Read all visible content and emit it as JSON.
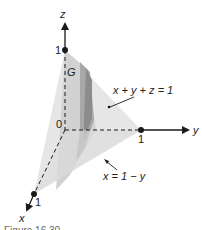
{
  "figure": {
    "axes": {
      "x": {
        "label": "x",
        "tick": "1"
      },
      "y": {
        "label": "y",
        "tick": "1"
      },
      "z": {
        "label": "z",
        "tick": "1"
      },
      "origin": "0"
    },
    "region_label": "G",
    "annotations": [
      {
        "text": "x + y + z = 1"
      },
      {
        "text": "x = 1 − y"
      }
    ],
    "caption": "Figure 16.30",
    "colors": {
      "plane_fill": "#e4e4e4",
      "shadow_fill": "#c4c4c4",
      "dark_band": "#9c9c9c",
      "axis": "#1a1a1a"
    }
  }
}
